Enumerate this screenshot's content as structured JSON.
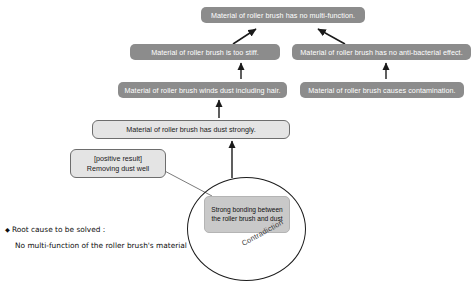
{
  "diagram": {
    "boxes": {
      "top": "Material of roller brush has no multi-function.",
      "stiff": "Material of roller brush is too stiff.",
      "antibacterial": "Material of roller brush has no anti-bacterial effect.",
      "winds_dust": "Material of roller brush winds dust including hair.",
      "contamination": "Material of roller brush causes contamination.",
      "dust_strongly": "Material of roller brush has dust strongly.",
      "positive_result_tag": "[positive result]",
      "positive_result_text": "Removing dust well",
      "contradiction_core": "Strong bonding between the roller brush and dust"
    },
    "contradiction_label": "Contradiction",
    "root_cause": {
      "bullet": "◆",
      "title": "Root cause to be solved :",
      "detail": "No multi-function of the roller brush's material"
    },
    "colors": {
      "box_fill": "#8c8c8c",
      "box_text": "#ffffff",
      "light_box_fill": "#e4e4e4",
      "light_box_border": "#6d6d6d",
      "inner_box_fill": "#c9c9c9",
      "arrow": "#1a1a1a",
      "circle_stroke": "#1c1c1c"
    }
  }
}
